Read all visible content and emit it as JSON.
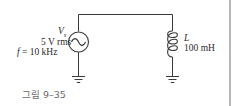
{
  "figure": {
    "caption": "그림 9–35",
    "source": {
      "symbol": "V",
      "subscript": "s",
      "voltage": "5 V rms",
      "frequency_prefix": "f",
      "frequency_value": "= 10 kHz",
      "icon": "ac-voltage-source-icon"
    },
    "inductor": {
      "symbol": "L",
      "value": "100 mH",
      "icon": "inductor-coil-icon"
    },
    "grounds": [
      "ground-icon",
      "ground-icon"
    ],
    "colors": {
      "wire": "#3a3a3a",
      "caption": "#6a6a6a",
      "edge_bar": "#b8b8b8"
    }
  }
}
